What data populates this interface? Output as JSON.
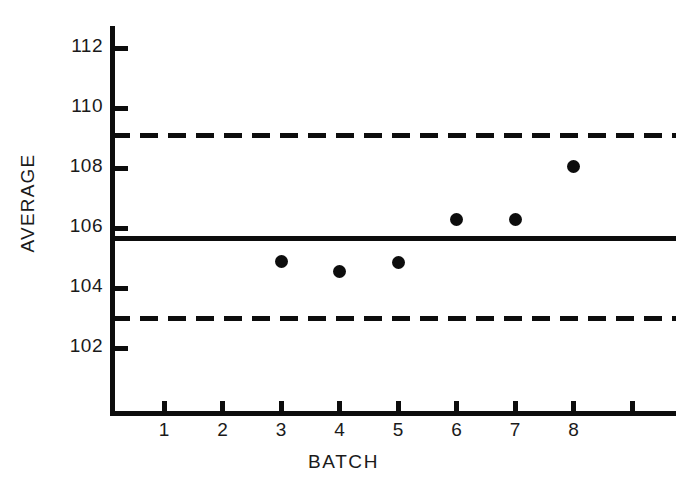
{
  "chart_data": {
    "type": "scatter",
    "title": "",
    "subtitle": "",
    "xlabel": "BATCH",
    "ylabel": "AVERAGE",
    "grid": false,
    "legend_position": "none",
    "x": [
      3,
      4,
      5,
      6,
      7,
      8
    ],
    "values": [
      104.9,
      104.55,
      104.85,
      106.3,
      106.3,
      108.05
    ],
    "series": [
      {
        "name": "Batch average",
        "x": [
          3,
          4,
          5,
          6,
          7,
          8
        ],
        "values": [
          104.9,
          104.55,
          104.85,
          106.3,
          106.3,
          108.05
        ]
      }
    ],
    "xlim": [
      0,
      9.7
    ],
    "ylim": [
      100.6,
      113.3
    ],
    "x_ticks": [
      1,
      2,
      3,
      4,
      5,
      6,
      7,
      8,
      9
    ],
    "x_tick_labels": [
      "1",
      "2",
      "3",
      "4",
      "5",
      "6",
      "7",
      "8",
      ""
    ],
    "y_ticks": [
      102,
      104,
      106,
      108,
      110,
      112
    ],
    "y_tick_labels": [
      "102",
      "104",
      "106",
      "108",
      "110",
      "112"
    ],
    "reference_lines": [
      {
        "name": "upper-control-limit",
        "value": 109.1,
        "style": "dashed"
      },
      {
        "name": "center-line",
        "value": 105.65,
        "style": "solid"
      },
      {
        "name": "lower-control-limit",
        "value": 102.97,
        "style": "dashed"
      }
    ]
  }
}
